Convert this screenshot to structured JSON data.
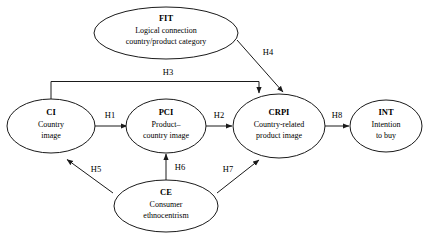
{
  "diagram": {
    "type": "path-model",
    "background_color": "#ffffff",
    "line_color": "#1a1a1a",
    "text_color": "#000000",
    "nodes": [
      {
        "id": "fit",
        "code": "FIT",
        "desc_line1": "Logical connection",
        "desc_line2": "country/product category"
      },
      {
        "id": "ci",
        "code": "CI",
        "desc_line1": "Country",
        "desc_line2": "image"
      },
      {
        "id": "pci",
        "code": "PCI",
        "desc_line1": "Product–",
        "desc_line2": "country image"
      },
      {
        "id": "crpi",
        "code": "CRPI",
        "desc_line1": "Country-related",
        "desc_line2": "product image"
      },
      {
        "id": "int",
        "code": "INT",
        "desc_line1": "Intention",
        "desc_line2": "to buy"
      },
      {
        "id": "ce",
        "code": "CE",
        "desc_line1": "Consumer",
        "desc_line2": "ethnocentrism"
      }
    ],
    "edges": [
      {
        "id": "h1",
        "label": "H1",
        "from": "ci",
        "to": "pci"
      },
      {
        "id": "h2",
        "label": "H2",
        "from": "pci",
        "to": "crpi"
      },
      {
        "id": "h3",
        "label": "H3",
        "from": "ci",
        "to": "crpi"
      },
      {
        "id": "h4",
        "label": "H4",
        "from": "fit",
        "to": "crpi"
      },
      {
        "id": "h5",
        "label": "H5",
        "from": "ce",
        "to": "ci"
      },
      {
        "id": "h6",
        "label": "H6",
        "from": "ce",
        "to": "pci"
      },
      {
        "id": "h7",
        "label": "H7",
        "from": "ce",
        "to": "crpi"
      },
      {
        "id": "h8",
        "label": "H8",
        "from": "crpi",
        "to": "int"
      }
    ]
  }
}
